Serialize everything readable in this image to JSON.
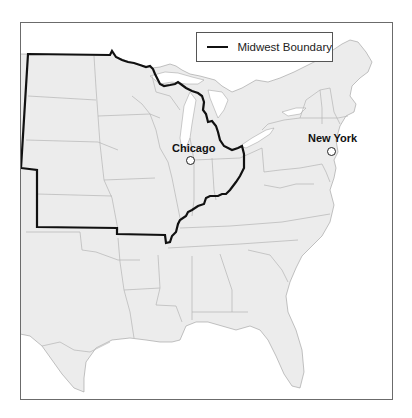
{
  "map": {
    "type": "reference map",
    "region": "Eastern and Central United States",
    "land_color": "#ececec",
    "state_border_color": "#b0b0b0",
    "boundary_color": "#111111",
    "water_color": "#ffffff"
  },
  "legend": {
    "items": [
      {
        "label": "Midwest Boundary",
        "symbol": "solid-thick-line",
        "color": "#111111"
      }
    ]
  },
  "cities": [
    {
      "name": "Chicago",
      "marker": "open-circle"
    },
    {
      "name": "New York",
      "marker": "open-circle"
    }
  ],
  "caption": {
    "text": ""
  }
}
